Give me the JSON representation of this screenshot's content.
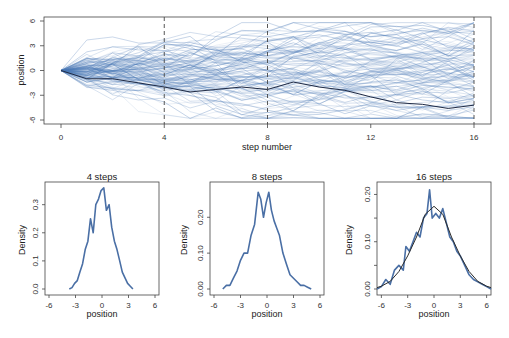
{
  "chart_data": [
    {
      "type": "line",
      "title": "",
      "xlabel": "step number",
      "ylabel": "position",
      "xlim": [
        0,
        16
      ],
      "ylim": [
        -6,
        6
      ],
      "xticks": [
        0,
        4,
        8,
        12,
        16
      ],
      "yticks": [
        -6,
        -3,
        0,
        3,
        6
      ],
      "vlines": [
        4,
        8,
        16
      ],
      "vline_style": "dashed",
      "series_description": "~100 random walks of 16 steps starting at 0, drawn in translucent blue; one highlighted walk in dark navy",
      "highlighted_walk": {
        "x": [
          0,
          1,
          2,
          3,
          4,
          5,
          6,
          7,
          8,
          9,
          10,
          11,
          12,
          13,
          14,
          15,
          16
        ],
        "y": [
          0,
          -1,
          -1,
          -1.5,
          -2,
          -2.6,
          -2.3,
          -2,
          -2.3,
          -1.4,
          -2,
          -2.4,
          -3.2,
          -3.9,
          -4.1,
          -4.6,
          -4.2
        ]
      },
      "colors": {
        "walks": "#4a78b5",
        "highlight": "#1f2a44",
        "vline": "#444444"
      }
    },
    {
      "type": "line",
      "title": "4 steps",
      "xlabel": "position",
      "ylabel": "Density",
      "xlim": [
        -6,
        6
      ],
      "ylim": [
        0,
        0.37
      ],
      "xticks": [
        -6,
        -3,
        0,
        3,
        6
      ],
      "yticks": [
        0.0,
        0.1,
        0.2,
        0.3
      ],
      "ytick_labels": [
        "0.0",
        "0.1",
        "0.2",
        "0.3"
      ],
      "x": [
        -3.7,
        -3.4,
        -3.1,
        -2.8,
        -2.5,
        -2.2,
        -1.9,
        -1.6,
        -1.3,
        -1.0,
        -0.7,
        -0.4,
        -0.1,
        0.2,
        0.5,
        0.8,
        1.1,
        1.4,
        1.7,
        2.0,
        2.3,
        2.6,
        2.9,
        3.2,
        3.5
      ],
      "y": [
        0.0,
        0.005,
        0.02,
        0.03,
        0.06,
        0.09,
        0.14,
        0.17,
        0.25,
        0.2,
        0.3,
        0.32,
        0.35,
        0.36,
        0.28,
        0.3,
        0.22,
        0.17,
        0.14,
        0.1,
        0.06,
        0.04,
        0.02,
        0.01,
        0.0
      ],
      "color": "#4a6fa5"
    },
    {
      "type": "line",
      "title": "8 steps",
      "xlabel": "position",
      "ylabel": "Density",
      "xlim": [
        -6,
        6
      ],
      "ylim": [
        0,
        0.29
      ],
      "xticks": [
        -6,
        -3,
        0,
        3,
        6
      ],
      "yticks": [
        0.0,
        0.1,
        0.2
      ],
      "ytick_labels": [
        "0.00",
        "0.10",
        "0.20"
      ],
      "x": [
        -5.0,
        -4.6,
        -4.2,
        -3.8,
        -3.4,
        -3.0,
        -2.6,
        -2.2,
        -1.8,
        -1.4,
        -1.0,
        -0.7,
        -0.4,
        -0.1,
        0.2,
        0.5,
        0.8,
        1.1,
        1.4,
        1.8,
        2.2,
        2.6,
        3.0,
        3.4,
        3.8,
        4.2,
        4.6,
        5.0
      ],
      "y": [
        0.0,
        0.01,
        0.01,
        0.03,
        0.05,
        0.08,
        0.1,
        0.1,
        0.15,
        0.18,
        0.27,
        0.25,
        0.2,
        0.24,
        0.27,
        0.22,
        0.19,
        0.17,
        0.15,
        0.1,
        0.07,
        0.04,
        0.03,
        0.02,
        0.01,
        0.01,
        0.005,
        0.0
      ],
      "color": "#4a6fa5"
    },
    {
      "type": "line",
      "title": "16 steps",
      "xlabel": "position",
      "ylabel": "Density",
      "xlim": [
        -6.5,
        6.5
      ],
      "ylim": [
        0,
        0.22
      ],
      "xticks": [
        -6,
        -3,
        0,
        3,
        6
      ],
      "yticks": [
        0.0,
        0.05,
        0.1,
        0.15,
        0.2
      ],
      "ytick_labels": [
        "0.00",
        "",
        "0.10",
        "",
        "0.20"
      ],
      "series": [
        {
          "name": "empirical density",
          "x": [
            -6.5,
            -6.0,
            -5.5,
            -5.0,
            -4.5,
            -4.0,
            -3.5,
            -3.2,
            -2.8,
            -2.4,
            -2.0,
            -1.6,
            -1.2,
            -0.8,
            -0.5,
            -0.2,
            0.2,
            0.6,
            1.0,
            1.4,
            1.8,
            2.2,
            2.6,
            3.0,
            3.5,
            4.0,
            4.5,
            5.0,
            5.5,
            6.0,
            6.5
          ],
          "y": [
            0.0,
            0.005,
            0.02,
            0.01,
            0.04,
            0.05,
            0.04,
            0.09,
            0.08,
            0.1,
            0.12,
            0.11,
            0.15,
            0.16,
            0.21,
            0.15,
            0.16,
            0.15,
            0.17,
            0.14,
            0.11,
            0.1,
            0.08,
            0.07,
            0.05,
            0.03,
            0.02,
            0.015,
            0.01,
            0.005,
            0.0
          ],
          "color": "#4a6fa5"
        },
        {
          "name": "normal curve (mean 0, sd ~2.3)",
          "x": [
            -6.5,
            -6,
            -5,
            -4,
            -3,
            -2,
            -1,
            0,
            1,
            2,
            3,
            4,
            5,
            6,
            6.5
          ],
          "y": [
            0.003,
            0.006,
            0.016,
            0.037,
            0.07,
            0.11,
            0.158,
            0.175,
            0.158,
            0.11,
            0.07,
            0.037,
            0.016,
            0.006,
            0.003
          ],
          "color": "#2b2b2b"
        }
      ]
    }
  ]
}
